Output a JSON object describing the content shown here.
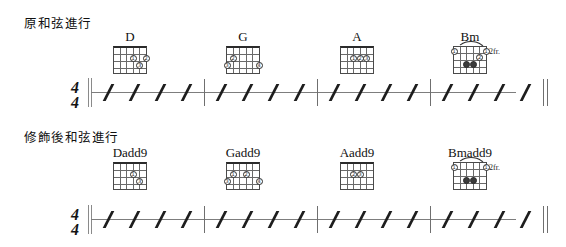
{
  "page": {
    "width": 566,
    "height": 247,
    "background": "#ffffff",
    "ink": "#1a1a1a"
  },
  "systems": [
    {
      "id": "original",
      "label": "原和弦進行",
      "time_signature": {
        "numerator": "4",
        "denominator": "4"
      },
      "measures": [
        {
          "chord": "D",
          "beats": 4
        },
        {
          "chord": "G",
          "beats": 4
        },
        {
          "chord": "A",
          "beats": 4
        },
        {
          "chord": "Bm",
          "beats": 4
        }
      ],
      "chords": [
        {
          "name": "D",
          "position_label": "",
          "open_nut": true,
          "strings": 6,
          "frets": 4,
          "barre": false,
          "dots": [
            {
              "string": 3,
              "fret": 2,
              "finger": "1"
            },
            {
              "string": 1,
              "fret": 2,
              "finger": "2"
            },
            {
              "string": 2,
              "fret": 3,
              "finger": "3"
            }
          ]
        },
        {
          "name": "G",
          "position_label": "",
          "open_nut": true,
          "strings": 6,
          "frets": 4,
          "barre": false,
          "dots": [
            {
              "string": 5,
              "fret": 2,
              "finger": "2"
            },
            {
              "string": 6,
              "fret": 3,
              "finger": "3"
            },
            {
              "string": 1,
              "fret": 3,
              "finger": "4"
            }
          ]
        },
        {
          "name": "A",
          "position_label": "",
          "open_nut": true,
          "strings": 6,
          "frets": 4,
          "barre": false,
          "dots": [
            {
              "string": 4,
              "fret": 2,
              "finger": "1"
            },
            {
              "string": 3,
              "fret": 2,
              "finger": "2"
            },
            {
              "string": 2,
              "fret": 2,
              "finger": "3"
            }
          ]
        },
        {
          "name": "Bm",
          "position_label": "2fr.",
          "open_nut": false,
          "strings": 6,
          "frets": 4,
          "barre": true,
          "dots": [
            {
              "string": 5,
              "fret": 1,
              "finger": "1"
            },
            {
              "string": 1,
              "fret": 1,
              "finger": "1"
            },
            {
              "string": 2,
              "fret": 2,
              "finger": "2"
            },
            {
              "string": 4,
              "fret": 3,
              "finger": "3"
            },
            {
              "string": 3,
              "fret": 3,
              "finger": "4"
            }
          ]
        }
      ]
    },
    {
      "id": "embellished",
      "label": "修飾後和弦進行",
      "time_signature": {
        "numerator": "4",
        "denominator": "4"
      },
      "measures": [
        {
          "chord": "Dadd9",
          "beats": 4
        },
        {
          "chord": "Gadd9",
          "beats": 4
        },
        {
          "chord": "Aadd9",
          "beats": 4
        },
        {
          "chord": "Bmadd9",
          "beats": 4
        }
      ],
      "chords": [
        {
          "name": "Dadd9",
          "position_label": "",
          "open_nut": true,
          "strings": 6,
          "frets": 4,
          "barre": false,
          "dots": [
            {
              "string": 3,
              "fret": 2,
              "finger": "1"
            },
            {
              "string": 2,
              "fret": 3,
              "finger": "3"
            }
          ]
        },
        {
          "name": "Gadd9",
          "position_label": "",
          "open_nut": true,
          "strings": 6,
          "frets": 4,
          "barre": false,
          "dots": [
            {
              "string": 5,
              "fret": 2,
              "finger": "1"
            },
            {
              "string": 3,
              "fret": 2,
              "finger": "2"
            },
            {
              "string": 6,
              "fret": 3,
              "finger": "3"
            },
            {
              "string": 1,
              "fret": 3,
              "finger": "4"
            }
          ]
        },
        {
          "name": "Aadd9",
          "position_label": "",
          "open_nut": true,
          "strings": 6,
          "frets": 4,
          "barre": false,
          "dots": [
            {
              "string": 4,
              "fret": 2,
              "finger": "2"
            },
            {
              "string": 3,
              "fret": 2,
              "finger": "3"
            }
          ]
        },
        {
          "name": "Bmadd9",
          "position_label": "2fr.",
          "open_nut": false,
          "strings": 6,
          "frets": 4,
          "barre": true,
          "dots": [
            {
              "string": 5,
              "fret": 1,
              "finger": "1"
            },
            {
              "string": 1,
              "fret": 1,
              "finger": "1"
            },
            {
              "string": 4,
              "fret": 3,
              "finger": "3"
            },
            {
              "string": 3,
              "fret": 3,
              "finger": "4"
            }
          ]
        }
      ]
    }
  ],
  "notation": {
    "slash_count_per_measure": 4,
    "staff_lines": 1,
    "end_barline": "double"
  }
}
